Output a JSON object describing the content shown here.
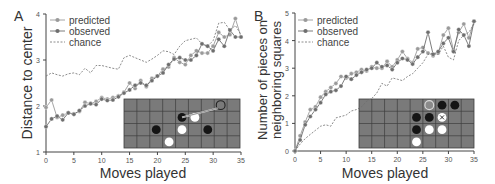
{
  "panels": [
    {
      "label": "A"
    },
    {
      "label": "B"
    }
  ],
  "legend": {
    "predicted": "predicted",
    "observed": "observed",
    "chance": "chance"
  },
  "colors": {
    "predicted": "#9a9a9a",
    "observed": "#6e6e6e",
    "chance": "#6e6e6e",
    "board": "#7a7a7a",
    "grid": "#3e3e3e",
    "black_piece": "#151515",
    "white_piece": "#ffffff"
  },
  "chart_data": [
    {
      "type": "line",
      "panel": "A",
      "title": "",
      "xlabel": "Moves played",
      "ylabel": "Distance to center",
      "xlim": [
        0,
        35
      ],
      "ylim": [
        1,
        4
      ],
      "xticks": [
        0,
        5,
        10,
        15,
        20,
        25,
        30,
        35
      ],
      "yticks": [
        1,
        2,
        3,
        4
      ],
      "grid": false,
      "legend_position": "upper left",
      "x": [
        0,
        1,
        2,
        3,
        4,
        5,
        6,
        7,
        8,
        9,
        10,
        11,
        12,
        13,
        14,
        15,
        16,
        17,
        18,
        19,
        20,
        21,
        22,
        23,
        24,
        25,
        26,
        27,
        28,
        29,
        30,
        31,
        32,
        33,
        34,
        35
      ],
      "series": [
        {
          "name": "predicted",
          "values": [
            1.97,
            2.13,
            1.75,
            1.8,
            1.85,
            1.83,
            1.88,
            2.08,
            2.05,
            2.1,
            2.18,
            2.15,
            2.18,
            2.22,
            2.3,
            2.5,
            2.38,
            2.55,
            2.42,
            2.6,
            2.65,
            2.8,
            2.85,
            3.05,
            2.95,
            2.9,
            3.1,
            3.2,
            3.15,
            3.15,
            3.3,
            3.6,
            3.5,
            3.55,
            3.9,
            3.5
          ]
        },
        {
          "name": "observed",
          "values": [
            1.55,
            1.72,
            1.78,
            1.7,
            1.85,
            1.82,
            1.9,
            2.0,
            2.05,
            2.03,
            2.15,
            2.12,
            2.13,
            2.2,
            2.28,
            2.35,
            2.45,
            2.5,
            2.45,
            2.55,
            2.65,
            2.72,
            2.9,
            3.02,
            3.05,
            3.0,
            3.0,
            3.1,
            3.35,
            3.3,
            3.2,
            3.45,
            3.3,
            3.65,
            3.5,
            3.5
          ]
        },
        {
          "name": "chance",
          "style": "dashed",
          "values": [
            2.65,
            2.72,
            2.68,
            2.65,
            2.7,
            2.72,
            2.68,
            2.82,
            2.72,
            2.88,
            2.88,
            2.85,
            2.82,
            2.8,
            3.05,
            3.1,
            3.05,
            3.0,
            2.95,
            3.02,
            3.1,
            3.2,
            3.18,
            3.12,
            3.3,
            3.42,
            3.45,
            3.48,
            3.35,
            3.3,
            3.42,
            3.8,
            3.82,
            3.65,
            3.75,
            3.55
          ]
        }
      ],
      "inset_board": {
        "cols": 9,
        "rows": 4,
        "pieces": [
          {
            "row": 0,
            "col": 7,
            "type": "highlight-open"
          },
          {
            "row": 1,
            "col": 4,
            "type": "black"
          },
          {
            "row": 1,
            "col": 5,
            "type": "white"
          },
          {
            "row": 2,
            "col": 2,
            "type": "black"
          },
          {
            "row": 2,
            "col": 4,
            "type": "white"
          },
          {
            "row": 2,
            "col": 6,
            "type": "black"
          },
          {
            "row": 3,
            "col": 3,
            "type": "white"
          }
        ],
        "arrow": {
          "from": {
            "row": 1.5,
            "col": 4.5
          },
          "to": {
            "row": 0.5,
            "col": 7.5
          }
        }
      }
    },
    {
      "type": "line",
      "panel": "B",
      "title": "",
      "xlabel": "Moves played",
      "ylabel": "Number of pieces on neighboring squares",
      "ylabel_lines": [
        "Number of pieces on",
        "neighboring squares"
      ],
      "xlim": [
        0,
        35
      ],
      "ylim": [
        0,
        5
      ],
      "xticks": [
        0,
        5,
        10,
        15,
        20,
        25,
        30,
        35
      ],
      "yticks": [
        0,
        1,
        2,
        3,
        4,
        5
      ],
      "grid": false,
      "legend_position": "upper left",
      "x": [
        0,
        1,
        2,
        3,
        4,
        5,
        6,
        7,
        8,
        9,
        10,
        11,
        12,
        13,
        14,
        15,
        16,
        17,
        18,
        19,
        20,
        21,
        22,
        23,
        24,
        25,
        26,
        27,
        28,
        29,
        30,
        31,
        32,
        33,
        34,
        35
      ],
      "series": [
        {
          "name": "predicted",
          "values": [
            0,
            0.55,
            1.05,
            1.5,
            1.6,
            1.95,
            2.15,
            2.3,
            2.45,
            2.7,
            2.65,
            2.8,
            2.85,
            2.95,
            2.9,
            3.05,
            3.0,
            3.0,
            3.25,
            3.05,
            3.3,
            3.6,
            3.35,
            3.2,
            3.7,
            3.75,
            3.55,
            3.45,
            3.55,
            4.2,
            4.45,
            3.65,
            4.3,
            4.6,
            4.1,
            4.7
          ]
        },
        {
          "name": "observed",
          "values": [
            0,
            0.4,
            0.95,
            1.25,
            1.5,
            1.75,
            2.05,
            2.15,
            2.2,
            2.35,
            2.7,
            2.6,
            2.75,
            2.85,
            2.95,
            3.0,
            3.2,
            3.05,
            3.1,
            2.95,
            3.2,
            3.35,
            3.3,
            3.15,
            3.4,
            3.6,
            4.3,
            3.5,
            3.6,
            3.9,
            4.1,
            3.6,
            4.4,
            4.2,
            3.8,
            4.7
          ]
        },
        {
          "name": "chance",
          "style": "dashed",
          "values": [
            0,
            0.25,
            0.45,
            0.6,
            0.75,
            0.9,
            0.95,
            0.9,
            1.2,
            1.25,
            1.3,
            1.45,
            1.5,
            1.6,
            1.8,
            1.9,
            2.1,
            2.45,
            2.35,
            2.65,
            2.6,
            2.55,
            2.7,
            2.8,
            3.0,
            3.2,
            3.5,
            3.55,
            3.5,
            3.8,
            3.4,
            3.3,
            4.0,
            4.2,
            4.3,
            4.6
          ]
        }
      ],
      "inset_board": {
        "cols": 9,
        "rows": 4,
        "pieces": [
          {
            "row": 0,
            "col": 5,
            "type": "highlight-gray"
          },
          {
            "row": 0,
            "col": 6,
            "type": "black"
          },
          {
            "row": 0,
            "col": 7,
            "type": "black"
          },
          {
            "row": 1,
            "col": 4,
            "type": "black"
          },
          {
            "row": 1,
            "col": 5,
            "type": "black"
          },
          {
            "row": 1,
            "col": 6,
            "type": "white-x"
          },
          {
            "row": 2,
            "col": 4,
            "type": "black"
          },
          {
            "row": 2,
            "col": 5,
            "type": "white"
          },
          {
            "row": 2,
            "col": 6,
            "type": "white"
          },
          {
            "row": 3,
            "col": 4,
            "type": "white"
          }
        ]
      }
    }
  ]
}
